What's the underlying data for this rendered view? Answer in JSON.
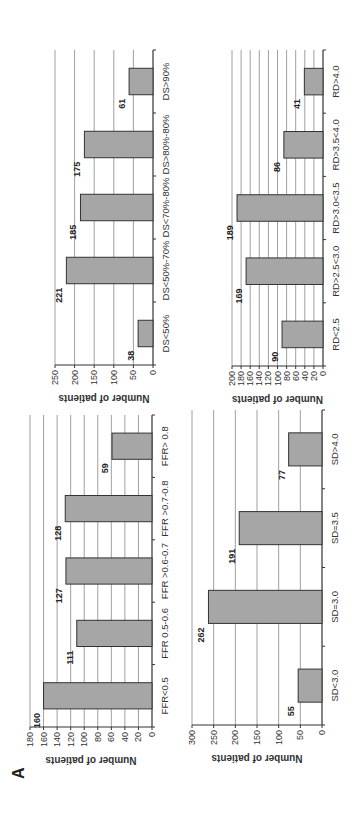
{
  "figure": {
    "panel_label": "A",
    "bar_color": "#a6a6a6",
    "bar_stroke": "#333333",
    "grid_color": "#888888"
  },
  "chart_data": [
    {
      "id": "ffr",
      "type": "bar",
      "title": "",
      "xlabel": "",
      "ylabel": "Number of patients",
      "categories": [
        "FFR<0.5",
        "FFR 0.5-0.6",
        "FFR >0.6-0.7",
        "FFR >0.7-0.8",
        "FFR> 0.8"
      ],
      "values": [
        160,
        111,
        127,
        128,
        59
      ],
      "ylim": [
        0,
        180
      ],
      "yticks": [
        0,
        20,
        40,
        60,
        80,
        100,
        120,
        140,
        160,
        180
      ],
      "grid": true
    },
    {
      "id": "ds",
      "type": "bar",
      "title": "",
      "xlabel": "",
      "ylabel": "Number of patients",
      "categories": [
        "DS<50%",
        "DS<50%-70%",
        "DS<70%-80%",
        "DS>80%-80%",
        "DS>90%"
      ],
      "values": [
        38,
        221,
        185,
        175,
        61
      ],
      "ylim": [
        0,
        250
      ],
      "yticks": [
        0,
        50,
        100,
        150,
        200,
        250
      ],
      "grid": true
    },
    {
      "id": "sd",
      "type": "bar",
      "title": "",
      "xlabel": "",
      "ylabel": "Number of patients",
      "categories": [
        "SD<3.0",
        "SD=3.0",
        "SD=3.5",
        "SD>4.0"
      ],
      "values": [
        55,
        262,
        191,
        77
      ],
      "ylim": [
        0,
        300
      ],
      "yticks": [
        0,
        50,
        100,
        150,
        200,
        250,
        300
      ],
      "grid": true
    },
    {
      "id": "rd",
      "type": "bar",
      "title": "",
      "xlabel": "",
      "ylabel": "Number of patients",
      "categories": [
        "RD<2.5",
        "RD>2.5<3.0",
        "RD>3.0<3.5",
        "RD>3.5<4.0",
        "RD>4.0"
      ],
      "values": [
        90,
        169,
        189,
        86,
        41
      ],
      "ylim": [
        0,
        200
      ],
      "yticks": [
        0,
        20,
        40,
        60,
        80,
        100,
        120,
        140,
        160,
        180,
        200
      ],
      "grid": true
    }
  ]
}
